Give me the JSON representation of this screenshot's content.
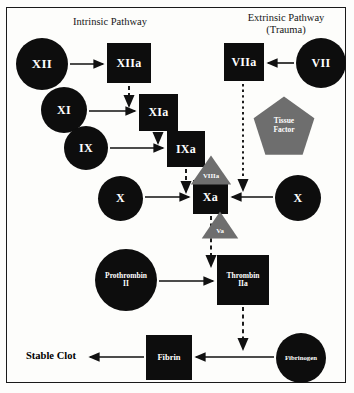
{
  "diagram": {
    "headers": {
      "intrinsic": "Intrinsic Pathway",
      "extrinsic_line1": "Extrinsic Pathway",
      "extrinsic_line2": "(Trauma)"
    },
    "labels": {
      "stable_clot": "Stable Clot"
    },
    "colors": {
      "node_fill": "#0d0d0d",
      "cofactor_fill": "#6e6e6e",
      "text_on_node": "#ffffff",
      "arrow": "#111111",
      "frame": "#1a1a1a",
      "background": "#fdfdfb"
    },
    "nodes": [
      {
        "id": "XII",
        "shape": "circle",
        "text": "XII",
        "x": 16,
        "y": 38,
        "w": 52,
        "h": 52,
        "size": "f13"
      },
      {
        "id": "XIIa",
        "shape": "box",
        "text": "XIIa",
        "x": 107,
        "y": 43,
        "w": 44,
        "h": 40,
        "size": "f12"
      },
      {
        "id": "XI",
        "shape": "circle",
        "text": "XI",
        "x": 41,
        "y": 87,
        "w": 46,
        "h": 46,
        "size": "f12"
      },
      {
        "id": "XIa",
        "shape": "box",
        "text": "XIa",
        "x": 139,
        "y": 94,
        "w": 39,
        "h": 37,
        "size": "f12"
      },
      {
        "id": "IX",
        "shape": "circle",
        "text": "IX",
        "x": 64,
        "y": 126,
        "w": 44,
        "h": 44,
        "size": "f12"
      },
      {
        "id": "IXa",
        "shape": "box",
        "text": "IXa",
        "x": 167,
        "y": 131,
        "w": 38,
        "h": 36,
        "size": "f12"
      },
      {
        "id": "X_left",
        "shape": "circle",
        "text": "X",
        "x": 98,
        "y": 176,
        "w": 45,
        "h": 45,
        "size": "f12"
      },
      {
        "id": "Xa",
        "shape": "box",
        "text": "Xa",
        "x": 193,
        "y": 180,
        "w": 35,
        "h": 34,
        "size": "f12"
      },
      {
        "id": "X_right",
        "shape": "circle",
        "text": "X",
        "x": 275,
        "y": 175,
        "w": 46,
        "h": 46,
        "size": "f12"
      },
      {
        "id": "VIIIa",
        "shape": "triangle",
        "text": "VIIIa",
        "x": 190,
        "y": 155,
        "w": 42,
        "h": 30,
        "size": "f7"
      },
      {
        "id": "Va",
        "shape": "triangle",
        "text": "Va",
        "x": 201,
        "y": 211,
        "w": 38,
        "h": 28,
        "size": "f7"
      },
      {
        "id": "VIIa",
        "shape": "box",
        "text": "VIIa",
        "x": 224,
        "y": 43,
        "w": 40,
        "h": 38,
        "size": "f12"
      },
      {
        "id": "VII",
        "shape": "circle",
        "text": "VII",
        "x": 296,
        "y": 38,
        "w": 50,
        "h": 50,
        "size": "f12"
      },
      {
        "id": "TissueFactor",
        "shape": "pentagon",
        "text": "Tissue|Factor",
        "x": 253,
        "y": 96,
        "w": 62,
        "h": 60,
        "size": "f8"
      },
      {
        "id": "Prothrombin",
        "shape": "circle",
        "text": "Prothrombin|II",
        "x": 95,
        "y": 249,
        "w": 62,
        "h": 62,
        "size": "f8"
      },
      {
        "id": "Thrombin",
        "shape": "box",
        "text": "Thrombin|IIa",
        "x": 217,
        "y": 255,
        "w": 52,
        "h": 50,
        "size": "f8"
      },
      {
        "id": "Fibrin",
        "shape": "box",
        "text": "Fibrin",
        "x": 146,
        "y": 335,
        "w": 46,
        "h": 45,
        "size": "f9"
      },
      {
        "id": "Fibrinogen",
        "shape": "circle",
        "text": "Fibrinogen",
        "x": 276,
        "y": 333,
        "w": 50,
        "h": 50,
        "size": "f7"
      }
    ],
    "arrows": [
      {
        "id": "XII-to-XIIa",
        "style": "solid",
        "from": "XII",
        "to": "XIIa"
      },
      {
        "id": "XIIa-to-XIa",
        "style": "dashed",
        "from": "XIIa",
        "to": "XIa"
      },
      {
        "id": "XI-to-XIa",
        "style": "solid",
        "from": "XI",
        "to": "XIa"
      },
      {
        "id": "XIa-to-IXa",
        "style": "dashed",
        "from": "XIa",
        "to": "IXa"
      },
      {
        "id": "IX-to-IXa",
        "style": "solid",
        "from": "IX",
        "to": "IXa"
      },
      {
        "id": "IXa-to-Xa",
        "style": "dashed",
        "from": "IXa",
        "to": "Xa"
      },
      {
        "id": "Xleft-to-Xa",
        "style": "solid",
        "from": "X_left",
        "to": "Xa"
      },
      {
        "id": "Xright-to-Xa",
        "style": "solid",
        "from": "X_right",
        "to": "Xa"
      },
      {
        "id": "VII-to-VIIa",
        "style": "solid",
        "from": "VII",
        "to": "VIIa"
      },
      {
        "id": "VIIa-to-Xa",
        "style": "dashed",
        "from": "VIIa",
        "to": "Xa"
      },
      {
        "id": "Xa-to-Thrombin",
        "style": "dashed",
        "from": "Xa",
        "to": "Thrombin"
      },
      {
        "id": "Prothrombin-to-Thrombin",
        "style": "solid",
        "from": "Prothrombin",
        "to": "Thrombin"
      },
      {
        "id": "Thrombin-to-Fibrin",
        "style": "dashed",
        "from": "Thrombin",
        "to": "Fibrin"
      },
      {
        "id": "Fibrinogen-to-Fibrin",
        "style": "solid",
        "from": "Fibrinogen",
        "to": "Fibrin"
      },
      {
        "id": "Fibrin-to-StableClot",
        "style": "solid",
        "from": "Fibrin",
        "to": "StableClot"
      }
    ]
  }
}
